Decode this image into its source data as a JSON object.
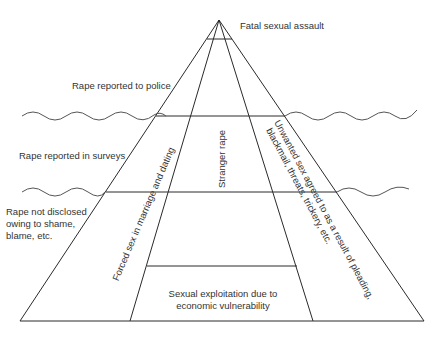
{
  "diagram": {
    "type": "iceberg-pyramid",
    "line_color": "#2a2a2a",
    "wave_color": "#555555",
    "labels": {
      "apex": "Fatal sexual assault",
      "police": "Rape reported to police",
      "surveys": "Rape reported in surveys",
      "not_disclosed": [
        "Rape not disclosed",
        "owing to shame,",
        "blame, etc."
      ],
      "left_column": "Forced sex in marriage and dating",
      "middle_column": "Stranger rape",
      "right_column_line1": "Unwanted sex agreed to as a result of pleading,",
      "right_column_line2": "blackmail, threats, trickery, etc.",
      "bottom_box": [
        "Sexual exploitation due to",
        "economic vulnerability"
      ]
    }
  }
}
